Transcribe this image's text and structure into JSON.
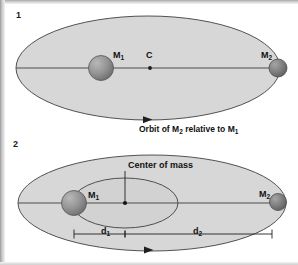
{
  "figure": {
    "background_color": "#ffffff",
    "ellipse_fill": "#d6d6d6",
    "ellipse_stroke": "#3a3a3a",
    "line_color": "#4a4a4a",
    "body_color": "#8a8a8a",
    "text_color": "#111111"
  },
  "panels": [
    {
      "number": "1",
      "name": "relative-orbit-panel",
      "labels": {
        "m1": "M",
        "m1_sub": "1",
        "m2": "M",
        "m2_sub": "2",
        "center": "C"
      },
      "caption": {
        "pre": "Orbit of M",
        "sub1": "2",
        "mid": " relative to M",
        "sub2": "1"
      }
    },
    {
      "number": "2",
      "name": "center-of-mass-panel",
      "labels": {
        "m1": "M",
        "m1_sub": "1",
        "m2": "M",
        "m2_sub": "2",
        "center_of_mass": "Center of mass",
        "d1": "d",
        "d1_sub": "1",
        "d2": "d",
        "d2_sub": "2"
      }
    }
  ]
}
